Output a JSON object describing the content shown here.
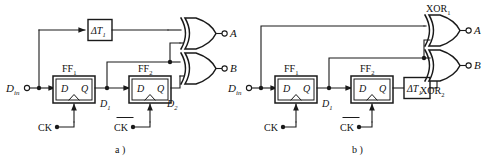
{
  "figure": {
    "type": "circuit-diagram",
    "stroke_color": "#1a1a1a",
    "text_color": "#111111",
    "background": "#ffffff"
  },
  "panel_a": {
    "caption": "a )",
    "input_label": "D",
    "input_sub": "in",
    "delay_block": {
      "label": "ΔT",
      "sub": "1",
      "name": "delay-block-dt1"
    },
    "flipflops": [
      {
        "name": "FF",
        "sub": "1",
        "d_label": "D",
        "q_label": "Q"
      },
      {
        "name": "FF",
        "sub": "2",
        "d_label": "D",
        "q_label": "Q"
      }
    ],
    "node_labels": [
      {
        "text": "D",
        "sub": "1"
      },
      {
        "text": "D",
        "sub": "2"
      }
    ],
    "clocks": [
      {
        "label": "CK",
        "inverted": false
      },
      {
        "label": "CK",
        "inverted": true
      }
    ],
    "outputs": [
      {
        "label": "A"
      },
      {
        "label": "B"
      }
    ],
    "gates": [
      {
        "type": "XOR",
        "output": "A"
      },
      {
        "type": "XOR",
        "output": "B"
      }
    ]
  },
  "panel_b": {
    "caption": "b )",
    "input_label": "D",
    "input_sub": "in",
    "delay_block": {
      "label": "ΔT",
      "sub": "1",
      "name": "delay-block-dt1"
    },
    "flipflops": [
      {
        "name": "FF",
        "sub": "1",
        "d_label": "D",
        "q_label": "Q"
      },
      {
        "name": "FF",
        "sub": "2",
        "d_label": "D",
        "q_label": "Q"
      }
    ],
    "node_labels": [
      {
        "text": "D",
        "sub": "1"
      }
    ],
    "clocks": [
      {
        "label": "CK",
        "inverted": false
      },
      {
        "label": "CK",
        "inverted": true
      }
    ],
    "outputs": [
      {
        "label": "A"
      },
      {
        "label": "B"
      }
    ],
    "gates": [
      {
        "type": "XOR",
        "label": "XOR",
        "sub": "1",
        "output": "A"
      },
      {
        "type": "XOR",
        "label": "XOR",
        "sub": "2",
        "output": "B"
      }
    ]
  }
}
